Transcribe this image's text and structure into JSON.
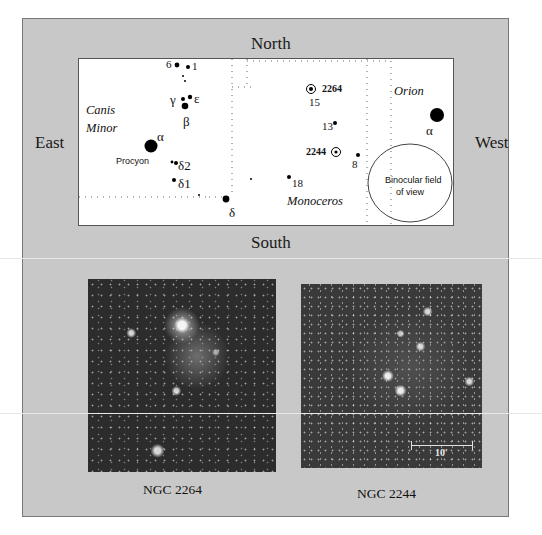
{
  "directions": {
    "north": "North",
    "south": "South",
    "east": "East",
    "west": "West"
  },
  "chart": {
    "constellations": {
      "canis_minor_line1": "Canis",
      "canis_minor_line2": "Minor",
      "monoceros": "Monoceros",
      "orion": "Orion"
    },
    "star_labels": {
      "six": "6",
      "one": "1",
      "gamma": "γ",
      "epsilon": "ε",
      "beta": "β",
      "alpha_cmi": "α",
      "procyon": "Procyon",
      "delta2": "δ2",
      "delta1": "δ1",
      "delta_mon": "δ",
      "fifteen": "15",
      "thirteen": "13",
      "eight": "8",
      "eighteen": "18",
      "alpha_ori": "α"
    },
    "clusters": {
      "ngc2264": "2264",
      "ngc2244": "2244"
    },
    "binocular_field": {
      "line1": "Binocular field",
      "line2": "of view"
    }
  },
  "photos": [
    {
      "caption": "NGC 2264"
    },
    {
      "caption": "NGC 2244",
      "scale_bar": "10'"
    }
  ]
}
